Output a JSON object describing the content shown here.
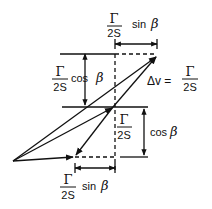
{
  "diagram": {
    "type": "vector-diagram",
    "colors": {
      "ink": "#111111",
      "background": "#ffffff"
    },
    "labels": {
      "top_sin": {
        "numerator": "Γ",
        "denominator": "2S",
        "func": "sin",
        "angle": "β"
      },
      "left_cos": {
        "numerator": "Γ",
        "denominator": "2S",
        "func": "cos",
        "angle": "β"
      },
      "right_cos": {
        "numerator": "Γ",
        "denominator": "2S",
        "func": "cos",
        "angle": "β"
      },
      "bottom_sin": {
        "numerator": "Γ",
        "denominator": "2S",
        "func": "sin",
        "angle": "β"
      },
      "delta_v": {
        "lhs": "Δv =",
        "numerator": "Γ",
        "denominator": "2S"
      }
    }
  }
}
